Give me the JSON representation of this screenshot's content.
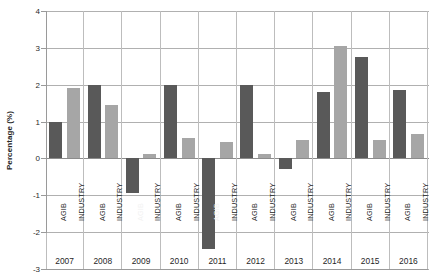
{
  "chart_data": {
    "type": "bar",
    "title": "",
    "xlabel": "",
    "ylabel": "Percentage (%)",
    "ylim": [
      -3,
      4
    ],
    "yticks": [
      4,
      3,
      2,
      1,
      0,
      -1,
      -2,
      -3
    ],
    "ytick_labels": [
      "4",
      "3",
      "2",
      "1",
      "0",
      "-1",
      "-2",
      "-3"
    ],
    "grid": true,
    "legend": "none",
    "categories": [
      "2007",
      "2008",
      "2009",
      "2010",
      "2011",
      "2012",
      "2013",
      "2014",
      "2015",
      "2016"
    ],
    "series": [
      {
        "name": "AGIB",
        "color": "#595959",
        "values": [
          1.0,
          2.0,
          -0.95,
          2.0,
          -2.45,
          2.0,
          -0.3,
          1.8,
          2.75,
          1.85
        ]
      },
      {
        "name": "INDUSTRY",
        "color": "#a6a6a6",
        "values": [
          1.9,
          1.45,
          0.12,
          0.55,
          0.45,
          0.12,
          0.5,
          3.05,
          0.5,
          0.65
        ]
      }
    ],
    "bar_labels": [
      "AGIB",
      "INDUSTRY",
      "AGIB",
      "INDUSTRY",
      "AGIB",
      "INDUSTRY",
      "AGIB",
      "INDUSTRY",
      "AGIB",
      "INDUSTRY",
      "AGIB",
      "INDUSTRY",
      "AGIB",
      "INDUSTRY",
      "AGIB",
      "INDUSTRY",
      "AGIB",
      "INDUSTRY",
      "AGIB",
      "INDUSTRY"
    ]
  },
  "axis": {
    "y_title": "Percentage (%)"
  }
}
